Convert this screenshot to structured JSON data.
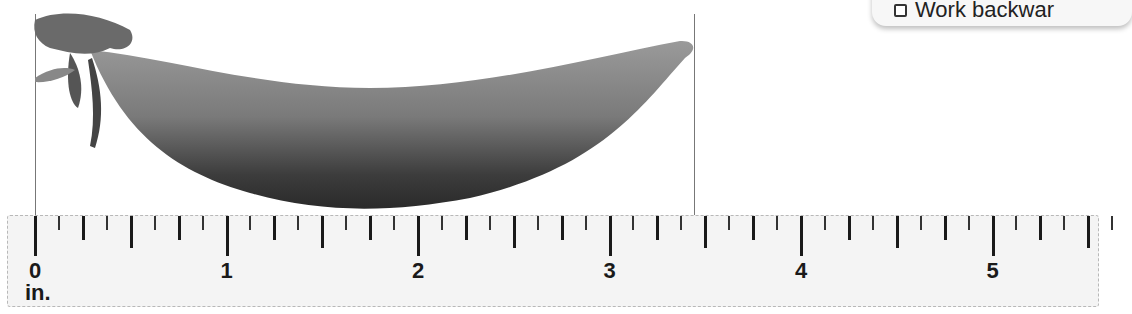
{
  "popup": {
    "checkbox_checked": false,
    "label": "Work backwar"
  },
  "object": {
    "name": "pea pod",
    "left_edge_in": 0,
    "right_edge_in": 3.45
  },
  "ruler": {
    "unit": "in.",
    "labels": [
      "0",
      "1",
      "2",
      "3",
      "4",
      "5"
    ],
    "origin_x": 27,
    "px_per_inch": 191.5,
    "ticks_per_inch": 8,
    "max_inch": 5.625,
    "colors": {
      "background": "#f4f4f4",
      "tick": "#1a1a1a"
    }
  }
}
